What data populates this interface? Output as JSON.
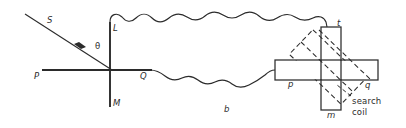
{
  "figure": {
    "caption": "b",
    "type": "physics-optics-magnetic-diagram",
    "background": "#ffffff",
    "stroke_color": "#2b2b2b",
    "labels": {
      "ray_source": "S",
      "angle": "θ",
      "axis_left": "P",
      "axis_right": "Q",
      "axis_top": "L",
      "axis_bottom": "M",
      "cross_top": "t",
      "cross_bottom": "m",
      "cross_left": "p",
      "cross_right": "q",
      "coil_line1": "search",
      "coil_line2": "coil",
      "caption": "b"
    },
    "label_positions": {
      "ray_source": {
        "x": 47,
        "y": 20
      },
      "angle": {
        "x": 95,
        "y": 46
      },
      "axis_left": {
        "x": 34,
        "y": 73
      },
      "axis_right": {
        "x": 140,
        "y": 73
      },
      "axis_top": {
        "x": 113,
        "y": 26
      },
      "axis_bottom": {
        "x": 113,
        "y": 101
      },
      "cross_top": {
        "x": 337,
        "y": 22
      },
      "cross_bottom": {
        "x": 327,
        "y": 113
      },
      "cross_left": {
        "x": 288,
        "y": 81
      },
      "cross_right": {
        "x": 365,
        "y": 82
      },
      "coil_text": {
        "x": 352,
        "y": 100
      },
      "caption": {
        "x": 224,
        "y": 108
      }
    },
    "geometry": {
      "incident_ray": {
        "x1": 25,
        "y1": 14,
        "x2": 112,
        "y2": 70,
        "arrow_at": 0.62
      },
      "axis_horizontal": {
        "x1": 42,
        "y1": 70,
        "x2": 152,
        "y2": 70
      },
      "axis_vertical": {
        "x1": 110,
        "y1": 22,
        "x2": 110,
        "y2": 107
      },
      "cross_vertical_bar": {
        "x": 321,
        "y": 27,
        "w": 20,
        "h": 83
      },
      "cross_horizontal_bar": {
        "x": 275,
        "y": 60,
        "w": 103,
        "h": 20
      },
      "search_coil_rect": {
        "cx": 327,
        "cy": 67,
        "w": 72,
        "h": 34,
        "rotation_deg": 44,
        "dashed": true
      },
      "wave_top": {
        "from_x": 110,
        "from_y": 22,
        "to_x": 327,
        "to_y": 27,
        "crests": 9
      },
      "wave_bottom": {
        "from_x": 152,
        "from_y": 70,
        "to_x": 275,
        "to_y": 70,
        "crests": 7
      },
      "coil_leader": {
        "x1": 351,
        "y1": 95,
        "x2": 339,
        "y2": 86
      }
    }
  }
}
